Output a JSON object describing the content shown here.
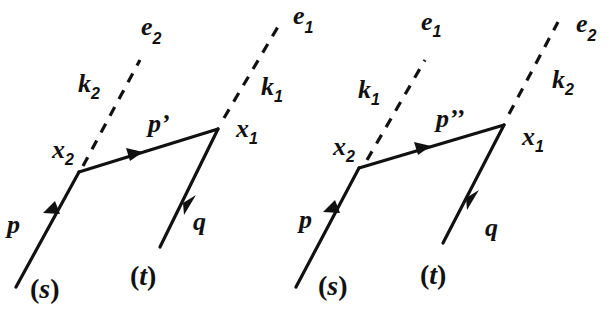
{
  "diagrams": [
    {
      "id": "left",
      "labels": {
        "incoming": "p",
        "internal": "p’",
        "outgoing": "q",
        "vertex_a": "x",
        "vertex_a_sub": "2",
        "vertex_b": "x",
        "vertex_b_sub": "1",
        "photon_a": "k",
        "photon_a_sub": "2",
        "photon_a_pol": "e",
        "photon_a_pol_sub": "2",
        "photon_b": "k",
        "photon_b_sub": "1",
        "photon_b_pol": "e",
        "photon_b_pol_sub": "1",
        "state_in": "s",
        "state_out": "t"
      }
    },
    {
      "id": "right",
      "labels": {
        "incoming": "p",
        "internal": "p’’",
        "outgoing": "q",
        "vertex_a": "x",
        "vertex_a_sub": "2",
        "vertex_b": "x",
        "vertex_b_sub": "1",
        "photon_a": "k",
        "photon_a_sub": "1",
        "photon_a_pol": "e",
        "photon_a_pol_sub": "1",
        "photon_b": "k",
        "photon_b_sub": "2",
        "photon_b_pol": "e",
        "photon_b_pol_sub": "2",
        "state_in": "s",
        "state_out": "t"
      }
    }
  ],
  "colors": {
    "ink": "#111111",
    "background": "#ffffff"
  }
}
